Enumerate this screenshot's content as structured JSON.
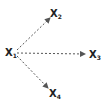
{
  "diagram": {
    "nodes": [
      {
        "id": "x1",
        "label": "X",
        "sub": "1",
        "x": 5,
        "y": 48
      },
      {
        "id": "x2",
        "label": "X",
        "sub": "2",
        "x": 50,
        "y": 9
      },
      {
        "id": "x3",
        "label": "X",
        "sub": "3",
        "x": 89,
        "y": 50
      },
      {
        "id": "x4",
        "label": "X",
        "sub": "4",
        "x": 49,
        "y": 89
      }
    ],
    "edges": [
      {
        "from": "x1",
        "to": "x2",
        "style": "dashed",
        "arrow": true
      },
      {
        "from": "x1",
        "to": "x3",
        "style": "dashed",
        "arrow": true
      },
      {
        "from": "x1",
        "to": "x4",
        "style": "dashed",
        "arrow": true
      }
    ],
    "colors": {
      "line": "#555555",
      "text": "#222222"
    }
  }
}
